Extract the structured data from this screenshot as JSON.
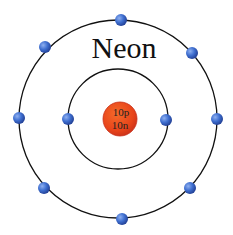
{
  "diagram": {
    "title": "Neon",
    "element": "Neon",
    "nucleus": {
      "protons_label": "10p",
      "neutrons_label": "10n",
      "fill": "#e8441a",
      "stroke": "#c8301a"
    },
    "shells": [
      {
        "name": "inner",
        "electrons": 2,
        "radius": 50
      },
      {
        "name": "outer",
        "electrons": 8,
        "radius": 99
      }
    ],
    "colors": {
      "electron": "#3f6fd0",
      "orbit": "#111111",
      "text": "#111111"
    }
  }
}
